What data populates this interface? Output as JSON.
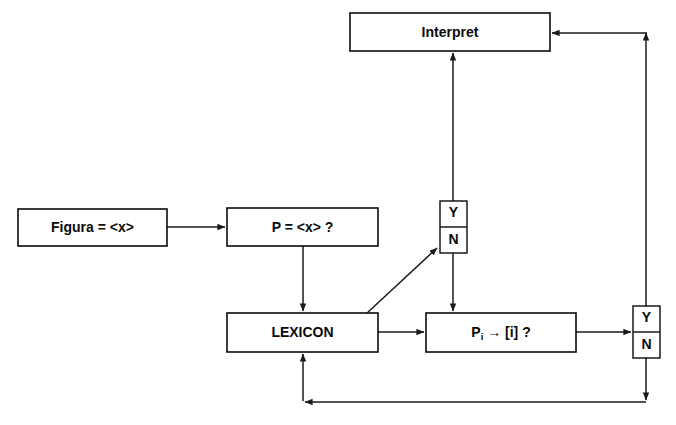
{
  "diagram": {
    "type": "flowchart",
    "title": "",
    "background_color": "#ffffff",
    "line_color": "#1a1a1a",
    "text_color": "#0a0a0a",
    "nodes": [
      {
        "id": "figura",
        "label": "Figura = <x>",
        "shape": "rectangle",
        "x": 18,
        "y": 209,
        "w": 149,
        "h": 37
      },
      {
        "id": "p_equals",
        "label": "P = <x> ?",
        "shape": "rectangle",
        "x": 227,
        "y": 208,
        "w": 151,
        "h": 38
      },
      {
        "id": "interpret",
        "label": "Interpret",
        "shape": "rectangle",
        "x": 350,
        "y": 13,
        "w": 200,
        "h": 38
      },
      {
        "id": "lexicon",
        "label": "LEXICON",
        "shape": "rectangle",
        "x": 227,
        "y": 313,
        "w": 151,
        "h": 39
      },
      {
        "id": "p_index",
        "label": "Pi → [i] ?",
        "label_base": "P",
        "label_subscript": "i",
        "label_rest": "→ [i] ?",
        "shape": "rectangle",
        "x": 426,
        "y": 313,
        "w": 150,
        "h": 39
      },
      {
        "id": "decision_top",
        "label": "Y / N",
        "shape": "split-box",
        "yes_label": "Y",
        "no_label": "N",
        "x": 440,
        "y": 201,
        "w": 27,
        "h": 52
      },
      {
        "id": "decision_right",
        "label": "Y / N",
        "shape": "split-box",
        "yes_label": "Y",
        "no_label": "N",
        "x": 633,
        "y": 306,
        "w": 27,
        "h": 52
      }
    ],
    "edges": [
      {
        "id": "figura-to-p",
        "from": "figura",
        "to": "p_equals",
        "label": "",
        "arrow": true
      },
      {
        "id": "p-to-lexicon",
        "from": "p_equals",
        "to": "lexicon",
        "label": "",
        "arrow": true
      },
      {
        "id": "lexicon-to-decision-top",
        "from": "lexicon",
        "to": "decision_top",
        "label": "",
        "arrow": true
      },
      {
        "id": "decision-top-yes-to-interpret",
        "from": "decision_top",
        "to": "interpret",
        "label": "Y",
        "arrow": true
      },
      {
        "id": "decision-top-no-to-p-index",
        "from": "decision_top",
        "to": "p_index",
        "label": "N",
        "arrow": true
      },
      {
        "id": "lexicon-to-p-index",
        "from": "lexicon",
        "to": "p_index",
        "label": "",
        "arrow": true
      },
      {
        "id": "p-index-to-decision-right",
        "from": "p_index",
        "to": "decision_right",
        "label": "",
        "arrow": true
      },
      {
        "id": "decision-right-yes-to-interpret",
        "from": "decision_right",
        "to": "interpret",
        "label": "Y",
        "arrow": true
      },
      {
        "id": "decision-right-no-to-lexicon",
        "from": "decision_right",
        "to": "lexicon",
        "label": "N",
        "arrow": true
      }
    ]
  }
}
